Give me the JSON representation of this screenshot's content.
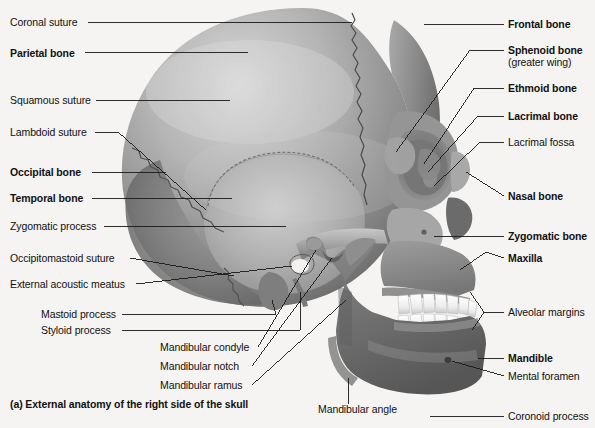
{
  "figure": {
    "caption": "(a) External anatomy of the right side of the skull",
    "background_color": "#f5f4f2",
    "text_color": "#111111",
    "leader_line_color": "#1a1a1a"
  },
  "labels_left": [
    {
      "id": "coronal-suture",
      "text": "Coronal suture",
      "bold": false,
      "x": 10,
      "y": 16
    },
    {
      "id": "parietal-bone",
      "text": "Parietal bone",
      "bold": true,
      "x": 10,
      "y": 47
    },
    {
      "id": "squamous-suture",
      "text": "Squamous suture",
      "bold": false,
      "x": 10,
      "y": 94
    },
    {
      "id": "lambdoid-suture",
      "text": "Lambdoid suture",
      "bold": false,
      "x": 10,
      "y": 126
    },
    {
      "id": "occipital-bone",
      "text": "Occipital bone",
      "bold": true,
      "x": 10,
      "y": 166
    },
    {
      "id": "temporal-bone",
      "text": "Temporal bone",
      "bold": true,
      "x": 10,
      "y": 192
    },
    {
      "id": "zygomatic-process",
      "text": "Zygomatic process",
      "bold": false,
      "x": 10,
      "y": 220
    },
    {
      "id": "occipitomastoid-suture",
      "text": "Occipitomastoid suture",
      "bold": false,
      "x": 10,
      "y": 252
    },
    {
      "id": "external-acoustic-meatus",
      "text": "External acoustic meatus",
      "bold": false,
      "x": 10,
      "y": 278
    },
    {
      "id": "mastoid-process",
      "text": "Mastoid process",
      "bold": false,
      "x": 41,
      "y": 308
    },
    {
      "id": "styloid-process",
      "text": "Styloid process",
      "bold": false,
      "x": 41,
      "y": 324
    },
    {
      "id": "mandibular-condyle",
      "text": "Mandibular condyle",
      "bold": false,
      "x": 160,
      "y": 341
    },
    {
      "id": "mandibular-notch",
      "text": "Mandibular notch",
      "bold": false,
      "x": 160,
      "y": 360
    },
    {
      "id": "mandibular-ramus",
      "text": "Mandibular ramus",
      "bold": false,
      "x": 160,
      "y": 379
    }
  ],
  "labels_right": [
    {
      "id": "frontal-bone",
      "text": "Frontal bone",
      "bold": true,
      "x": 508,
      "y": 19
    },
    {
      "id": "sphenoid-bone",
      "text": "Sphenoid bone",
      "bold": true,
      "x": 508,
      "y": 45
    },
    {
      "id": "sphenoid-sub",
      "text": "(greater wing)",
      "bold": false,
      "x": 508,
      "y": 57
    },
    {
      "id": "ethmoid-bone",
      "text": "Ethmoid bone",
      "bold": true,
      "x": 508,
      "y": 83
    },
    {
      "id": "lacrimal-bone",
      "text": "Lacrimal bone",
      "bold": true,
      "x": 508,
      "y": 111
    },
    {
      "id": "lacrimal-fossa",
      "text": "Lacrimal fossa",
      "bold": false,
      "x": 508,
      "y": 137
    },
    {
      "id": "nasal-bone",
      "text": "Nasal bone",
      "bold": true,
      "x": 508,
      "y": 190
    },
    {
      "id": "zygomatic-bone",
      "text": "Zygomatic bone",
      "bold": true,
      "x": 508,
      "y": 231
    },
    {
      "id": "maxilla",
      "text": "Maxilla",
      "bold": true,
      "x": 508,
      "y": 252
    },
    {
      "id": "alveolar-margins",
      "text": "Alveolar margins",
      "bold": false,
      "x": 508,
      "y": 308
    },
    {
      "id": "mandible",
      "text": "Mandible",
      "bold": true,
      "x": 508,
      "y": 352
    },
    {
      "id": "mental-foramen",
      "text": "Mental foramen",
      "bold": false,
      "x": 508,
      "y": 370
    },
    {
      "id": "coronoid-process",
      "text": "Coronoid process",
      "bold": false,
      "x": 508,
      "y": 411
    }
  ],
  "labels_bottom": [
    {
      "id": "mandibular-angle",
      "text": "Mandibular angle",
      "bold": false,
      "x": 318,
      "y": 409
    }
  ]
}
